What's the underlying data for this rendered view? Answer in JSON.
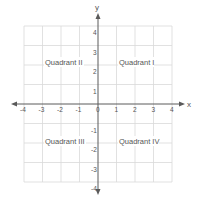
{
  "diagram": {
    "type": "cartesian-coordinate-plane",
    "axes": {
      "x_label": "x",
      "y_label": "y",
      "x_range": [
        -4,
        4
      ],
      "y_range": [
        -4,
        4
      ],
      "x_ticks": [
        "-4",
        "-3",
        "-2",
        "-1",
        "0",
        "1",
        "2",
        "3",
        "4"
      ],
      "y_ticks": [
        "4",
        "3",
        "2",
        "1",
        "-1",
        "-2",
        "-3",
        "-4"
      ]
    },
    "quadrants": [
      {
        "id": "I",
        "label": "Quadrant I"
      },
      {
        "id": "II",
        "label": "Quadrant II"
      },
      {
        "id": "III",
        "label": "Quadrant III"
      },
      {
        "id": "IV",
        "label": "Quadrant IV"
      }
    ],
    "colors": {
      "grid": "#d9d9d9",
      "axis": "#5a5a5a",
      "text": "#555555",
      "background": "#ffffff"
    }
  }
}
